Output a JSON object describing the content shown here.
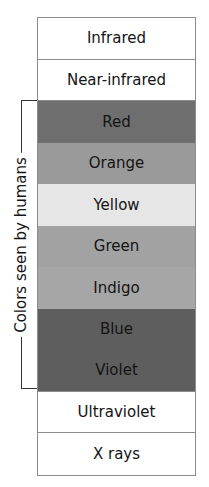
{
  "diagram": {
    "bands": [
      {
        "label": "Infrared",
        "color": "#ffffff"
      },
      {
        "label": "Near-infrared",
        "color": "#ffffff"
      },
      {
        "label": "Red",
        "color": "#6e6e6e"
      },
      {
        "label": "Orange",
        "color": "#9a9a9a"
      },
      {
        "label": "Yellow",
        "color": "#e6e6e6"
      },
      {
        "label": "Green",
        "color": "#a2a2a2"
      },
      {
        "label": "Indigo",
        "color": "#a6a6a6"
      },
      {
        "label": "Blue",
        "color": "#5e5e5e"
      },
      {
        "label": "Violet",
        "color": "#5e5e5e"
      },
      {
        "label": "Ultraviolet",
        "color": "#ffffff"
      },
      {
        "label": "X rays",
        "color": "#ffffff"
      }
    ],
    "bracket_label": "Colors seen by humans"
  }
}
